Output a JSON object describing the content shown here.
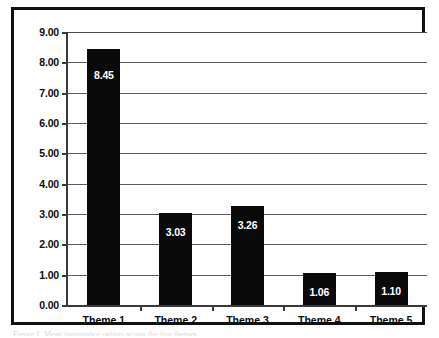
{
  "figure": {
    "caption_fragment": "Figure 1. Mean importance ratings across the five themes"
  },
  "chart_data": {
    "type": "bar",
    "title": "",
    "xlabel": "",
    "ylabel": "",
    "categories": [
      "Theme 1",
      "Theme 2",
      "Theme 3",
      "Theme 4",
      "Theme 5"
    ],
    "values": [
      8.45,
      3.03,
      3.26,
      1.06,
      1.1
    ],
    "value_labels": [
      "8.45",
      "3.03",
      "3.26",
      "1.06",
      "1.10"
    ],
    "ylim": [
      0.0,
      9.0
    ],
    "ytick_step": 1.0,
    "ytick_labels": [
      "9.00",
      "8.00",
      "7.00",
      "6.00",
      "5.00",
      "4.00",
      "3.00",
      "2.00",
      "1.00",
      "0.00"
    ],
    "ytick_values": [
      9.0,
      8.0,
      7.0,
      6.0,
      5.0,
      4.0,
      3.0,
      2.0,
      1.0,
      0.0
    ],
    "grid": true,
    "grid_axis": "y",
    "legend": false,
    "legend_position": "none",
    "bar_color": "#0a0a0a",
    "value_label_color": "#ffffff",
    "gridline_color": "#5b5b5b",
    "axis_color": "#3a3a3a",
    "frame_color": "#111111",
    "background_color": "#ffffff"
  }
}
